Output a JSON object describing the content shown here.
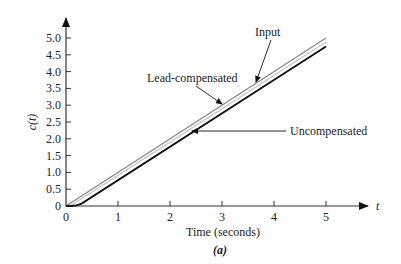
{
  "chart_data": {
    "type": "line",
    "title": "",
    "caption": "(a)",
    "xlabel": "Time (seconds)",
    "ylabel": "c(t)",
    "x_axis_symbol": "t",
    "xlim": [
      0,
      5
    ],
    "ylim": [
      0,
      5.0
    ],
    "x_ticks": [
      "0",
      "1",
      "2",
      "3",
      "4",
      "5"
    ],
    "y_ticks": [
      "0",
      "0.5",
      "1.0",
      "1.5",
      "2.0",
      "2.5",
      "3.0",
      "3.5",
      "4.0",
      "4.5",
      "5.0"
    ],
    "grid": false,
    "legend": "inline annotations with arrows",
    "series": [
      {
        "name": "Input",
        "color": "#8a8a8a",
        "x": [
          0,
          5
        ],
        "y": [
          0,
          5.0
        ]
      },
      {
        "name": "Lead-compensated",
        "color": "#c8c8c8",
        "x": [
          0,
          0.1,
          5
        ],
        "y": [
          0,
          0.02,
          4.88
        ]
      },
      {
        "name": "Uncompensated",
        "color": "#111111",
        "x": [
          0,
          0.1,
          0.2,
          0.3,
          5
        ],
        "y": [
          0,
          0.0,
          0.02,
          0.07,
          4.75
        ]
      }
    ],
    "annotations": [
      {
        "text": "Input",
        "target": "Input"
      },
      {
        "text": "Lead-compensated",
        "target": "Lead-compensated"
      },
      {
        "text": "Uncompensated",
        "target": "Uncompensated"
      }
    ]
  }
}
